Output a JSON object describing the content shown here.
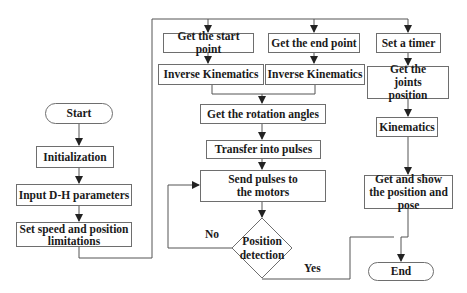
{
  "diagram": {
    "type": "flowchart",
    "nodes": {
      "start": "Start",
      "initialization": "Initialization",
      "input_dh": "Input D-H parameters",
      "set_speed": "Set speed and position limitations",
      "get_start_point": "Get the start point",
      "get_end_point": "Get the end point",
      "ik_start": "Inverse Kinematics",
      "ik_end": "Inverse Kinematics",
      "rotation_angles": "Get the rotation angles",
      "transfer_pulses": "Transfer into pulses",
      "send_pulses": "Send pulses to the motors",
      "position_detection": "Position detection",
      "set_timer": "Set a timer",
      "joints_position": "Get the joints position",
      "kinematics": "Kinematics",
      "show_pose": "Get and show the position and pose",
      "end": "End"
    },
    "edge_labels": {
      "no": "No",
      "yes": "Yes"
    },
    "colors": {
      "line": "#555555",
      "border": "#6e6e6e",
      "text": "#1a1a1a"
    }
  }
}
